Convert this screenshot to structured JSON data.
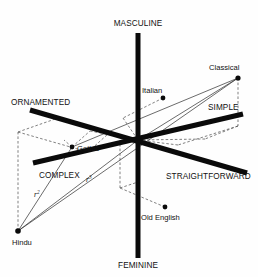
{
  "diagram": {
    "background_color": "#fefefe",
    "ink_color": "#0a0a0a",
    "origin": {
      "x": 138,
      "y": 140
    },
    "axes": [
      {
        "id": "vertical",
        "positive_label": "MASCULINE",
        "negative_label": "FEMININE",
        "positive_label_pos": {
          "x": 138,
          "y": 26
        },
        "negative_label_pos": {
          "x": 138,
          "y": 266
        },
        "x1": 138,
        "y1": 33,
        "x2": 138,
        "y2": 258
      },
      {
        "id": "ornament",
        "positive_label": "ORNAMENTED",
        "negative_label": "STRAIGHTFORWARD",
        "positive_label_pos": {
          "x": 12,
          "y": 104
        },
        "negative_label_pos": {
          "x": 160,
          "y": 178
        },
        "x1": 30,
        "y1": 110,
        "x2": 247,
        "y2": 173
      },
      {
        "id": "complexity",
        "positive_label": "COMPLEX",
        "negative_label": "SIMPLE",
        "positive_label_pos": {
          "x": 40,
          "y": 177
        },
        "negative_label_pos": {
          "x": 208,
          "y": 108
        },
        "x1": 33,
        "y1": 163,
        "x2": 243,
        "y2": 114
      }
    ],
    "points": [
      {
        "name": "Classical",
        "x": 238,
        "y": 78,
        "label_x": 209,
        "label_y": 70,
        "label_anchor": "start"
      },
      {
        "name": "Italian",
        "x": 163,
        "y": 98,
        "label_x": 142,
        "label_y": 92,
        "label_anchor": "start"
      },
      {
        "name": "Gothic",
        "x": 72,
        "y": 147,
        "label_x": 77,
        "label_y": 150,
        "label_anchor": "start"
      },
      {
        "name": "Old English",
        "x": 165,
        "y": 207,
        "label_x": 141,
        "label_y": 219,
        "label_anchor": "start"
      },
      {
        "name": "Hindu",
        "x": 18,
        "y": 231,
        "label_x": 13,
        "label_y": 244,
        "label_anchor": "start"
      }
    ],
    "annotations": [
      {
        "text": "r",
        "sup": "2",
        "x": 36,
        "y": 196
      },
      {
        "text": "r",
        "sup": "3",
        "x": 88,
        "y": 181
      }
    ],
    "connector_lines": [
      {
        "from": "origin",
        "to": "Classical"
      },
      {
        "from": "origin",
        "to": "Hindu"
      },
      {
        "from": "Classical",
        "to": "Hindu"
      },
      {
        "from": "Gothic",
        "to": "Hindu"
      },
      {
        "from": "Gothic",
        "to": "Classical"
      }
    ],
    "projection_boxes": [
      {
        "name": "classical-projection-box",
        "segments": [
          [
            [
              238,
              78
            ],
            [
              238,
              126
            ]
          ],
          [
            [
              238,
              126
            ],
            [
              205,
              139
            ]
          ],
          [
            [
              238,
              126
            ],
            [
              178,
              145
            ]
          ],
          [
            [
              205,
              139
            ],
            [
              138,
              140
            ]
          ],
          [
            [
              178,
              145
            ],
            [
              138,
              140
            ]
          ]
        ]
      },
      {
        "name": "italian-projection",
        "segments": [
          [
            [
              163,
              98
            ],
            [
              123,
              118
            ]
          ],
          [
            [
              123,
              118
            ],
            [
              138,
              140
            ]
          ]
        ]
      },
      {
        "name": "old-english-projection",
        "segments": [
          [
            [
              165,
              207
            ],
            [
              120,
              188
            ]
          ],
          [
            [
              120,
              188
            ],
            [
              120,
              140
            ]
          ],
          [
            [
              120,
              188
            ],
            [
              138,
              182
            ]
          ]
        ]
      },
      {
        "name": "hindu-projection-box",
        "segments": [
          [
            [
              18,
              231
            ],
            [
              18,
              132
            ]
          ],
          [
            [
              18,
              132
            ],
            [
              58,
              118
            ]
          ],
          [
            [
              18,
              132
            ],
            [
              88,
              152
            ]
          ],
          [
            [
              58,
              118
            ],
            [
              108,
              134
            ]
          ],
          [
            [
              88,
              152
            ],
            [
              108,
              134
            ]
          ],
          [
            [
              108,
              134
            ],
            [
              138,
              140
            ]
          ],
          [
            [
              58,
              118
            ],
            [
              78,
              125
            ]
          ]
        ]
      },
      {
        "name": "gothic-projection",
        "segments": [
          [
            [
              72,
              147
            ],
            [
              90,
              131
            ]
          ],
          [
            [
              90,
              131
            ],
            [
              138,
              140
            ]
          ],
          [
            [
              72,
              147
            ],
            [
              64,
              140
            ]
          ]
        ]
      }
    ]
  }
}
